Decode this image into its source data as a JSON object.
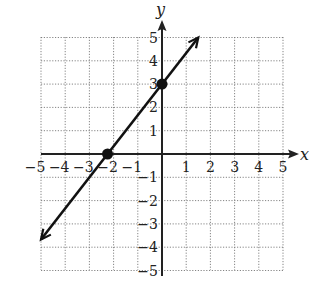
{
  "chart_data": {
    "type": "line",
    "title": "",
    "xlabel": "x",
    "ylabel": "y",
    "xlim": [
      -5,
      5
    ],
    "ylim": [
      -5,
      5
    ],
    "grid": true,
    "grid_style": "dotted",
    "x_ticks": [
      "−5",
      "−4",
      "−3",
      "−2",
      "−1",
      "1",
      "2",
      "3",
      "4",
      "5"
    ],
    "y_ticks": [
      "5",
      "4",
      "3",
      "2",
      "1",
      "−1",
      "−2",
      "−3",
      "−4",
      "−5"
    ],
    "series": [
      {
        "name": "line",
        "equation": "y = (4/3)x + 3",
        "slope": 1.333,
        "intercept": 3,
        "x": [
          -5,
          1.5
        ],
        "y": [
          -3.67,
          5
        ],
        "arrows_both_ends": true
      }
    ],
    "points": [
      {
        "label": "x-intercept",
        "x": -2.25,
        "y": 0
      },
      {
        "label": "y-intercept",
        "x": 0,
        "y": 3
      }
    ]
  }
}
